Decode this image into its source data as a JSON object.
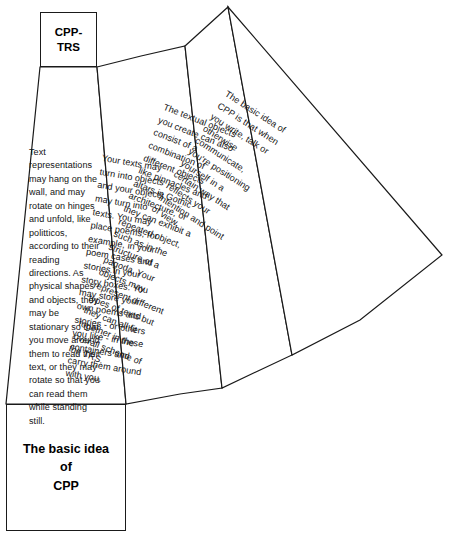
{
  "diagram": {
    "title_box": {
      "label": "CPP-\nTRS",
      "name": "cpp-trs-header-box"
    },
    "footer_box": {
      "label": "The basic idea\nof\nCPP",
      "name": "basic-idea-footer-box"
    },
    "panels": [
      {
        "id": "panel-1",
        "rotation_deg": 0,
        "text": "Text representations may hang on the wall, and may rotate on hinges and unfold, like politticos, according to their reading directions.  As physical shapes and objects, they may be stationary so that you move around them to read their text, or they may rotate so that you can read them while standing still."
      },
      {
        "id": "panel-2",
        "rotation_deg": 9.6,
        "text": "Your texts may turn into objects and your objects may turn into texts.  You may place poems, for example, in your poem cases and stories in your story boxes.  You may store your own poems and stories - or others you like - in these containers and carry them around with you."
      },
      {
        "id": "panel-3",
        "rotation_deg": 21.4,
        "text": "The textual objects you create can also consist of a combination of different objects like pinnacles and altars in Gothic architecture, or they can exhibit a repeated object, such as in the structure of a pagoda.  Your objects may represent different types of texts but they can all fit together in the overall scheme of the TRS."
      },
      {
        "id": "panel-4",
        "rotation_deg": 32.5,
        "text": "The basic idea of CPP is that when you write, talk or otherwise communicate, you're positioning yourself in a certain way that reflects your intention and point of view."
      }
    ],
    "colors": {
      "stroke": "#1a1a1a",
      "fill": "#ffffff",
      "text": "#141414"
    }
  }
}
